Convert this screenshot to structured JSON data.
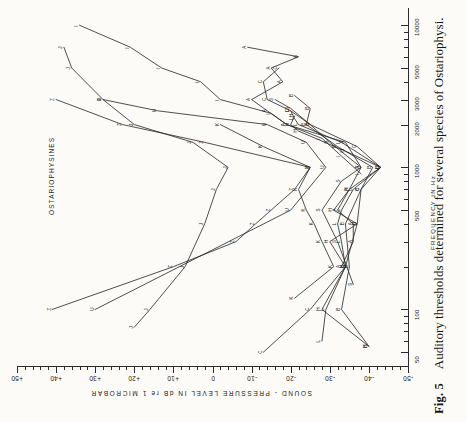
{
  "figure": {
    "number_label": "Fig. 5",
    "caption": "Auditory thresholds determined for several species of Ostariophysi.",
    "group_label": "OSTARIOPHYSINES"
  },
  "axes": {
    "x_title": "FREQUENCY  IN   Hz",
    "y_title": "SOUND - PRESSURE  LEVEL   IN   dB   re  1  MICROBAR",
    "x_tick_labels": [
      "50",
      "100",
      "500",
      "1000",
      "2000",
      "3000",
      "5000",
      "10000"
    ],
    "y_tick_labels": [
      "+50",
      "+40",
      "+30",
      "+20",
      "+10",
      "0",
      "-10",
      "-20",
      "-30",
      "-40",
      "-50"
    ]
  },
  "chart_data": {
    "type": "line",
    "title": "Auditory thresholds determined for several species of Ostariophysi.",
    "subtitle": "OSTARIOPHYSINES",
    "xlabel": "FREQUENCY  IN   Hz",
    "ylabel": "SOUND - PRESSURE  LEVEL   IN   dB   re  1  MICROBAR",
    "xscale": "log",
    "xlim": [
      40,
      12000
    ],
    "ylim": [
      -50,
      50
    ],
    "xticks": [
      50,
      100,
      500,
      1000,
      2000,
      3000,
      5000,
      10000
    ],
    "yticks": [
      50,
      40,
      30,
      20,
      10,
      0,
      -10,
      -20,
      -30,
      -40,
      -50
    ],
    "grid": false,
    "legend": "none (curves labelled by letter markers at each datum)",
    "orientation_note": "Scanned page is rotated 90 degrees counter-clockwise; frequency axis runs vertically up the right side, level axis runs horizontally along the bottom.",
    "series": [
      {
        "name": "Z",
        "marker": "Z",
        "points": [
          {
            "x": 100,
            "y": 41
          },
          {
            "x": 200,
            "y": 10
          },
          {
            "x": 300,
            "y": -6
          },
          {
            "x": 400,
            "y": -11
          },
          {
            "x": 500,
            "y": -15
          },
          {
            "x": 700,
            "y": -21
          },
          {
            "x": 1000,
            "y": -25
          },
          {
            "x": 1500,
            "y": 2
          },
          {
            "x": 2000,
            "y": 23
          },
          {
            "x": 3000,
            "y": 40
          }
        ]
      },
      {
        "name": "J",
        "marker": "J",
        "points": [
          {
            "x": 75,
            "y": 20
          },
          {
            "x": 100,
            "y": 16
          },
          {
            "x": 200,
            "y": 7
          },
          {
            "x": 400,
            "y": 2
          },
          {
            "x": 700,
            "y": -1
          },
          {
            "x": 1000,
            "y": -4
          },
          {
            "x": 1500,
            "y": 5
          },
          {
            "x": 2000,
            "y": 20
          },
          {
            "x": 3000,
            "y": 28
          },
          {
            "x": 5000,
            "y": 36
          },
          {
            "x": 7000,
            "y": 38
          }
        ]
      },
      {
        "name": "U",
        "marker": "U",
        "points": [
          {
            "x": 100,
            "y": 30
          },
          {
            "x": 500,
            "y": -20
          },
          {
            "x": 1000,
            "y": -29
          },
          {
            "x": 1500,
            "y": -24
          },
          {
            "x": 2000,
            "y": -14
          },
          {
            "x": 2500,
            "y": 14
          },
          {
            "x": 3000,
            "y": 28
          }
        ]
      },
      {
        "name": "I",
        "marker": "I",
        "points": [
          {
            "x": 900,
            "y": -38
          },
          {
            "x": 1200,
            "y": -33
          },
          {
            "x": 1600,
            "y": -28
          },
          {
            "x": 2000,
            "y": -19
          },
          {
            "x": 2400,
            "y": -15
          },
          {
            "x": 3000,
            "y": -2
          },
          {
            "x": 4000,
            "y": 3
          },
          {
            "x": 5000,
            "y": 13
          },
          {
            "x": 7000,
            "y": 21
          },
          {
            "x": 10000,
            "y": 34
          }
        ]
      },
      {
        "name": "A",
        "marker": "A",
        "points": [
          {
            "x": 200,
            "y": -33
          },
          {
            "x": 300,
            "y": -36
          },
          {
            "x": 400,
            "y": -36
          },
          {
            "x": 500,
            "y": -32
          },
          {
            "x": 700,
            "y": -35
          },
          {
            "x": 1000,
            "y": -38
          },
          {
            "x": 1500,
            "y": -34
          },
          {
            "x": 2000,
            "y": -19
          },
          {
            "x": 2500,
            "y": -14
          },
          {
            "x": 3000,
            "y": -10
          },
          {
            "x": 4000,
            "y": -18
          },
          {
            "x": 5000,
            "y": -15
          },
          {
            "x": 6000,
            "y": -22
          },
          {
            "x": 7000,
            "y": -9
          }
        ]
      },
      {
        "name": "C",
        "marker": "C",
        "points": [
          {
            "x": 50,
            "y": -13
          },
          {
            "x": 100,
            "y": -25
          },
          {
            "x": 200,
            "y": -34
          },
          {
            "x": 400,
            "y": -37
          },
          {
            "x": 700,
            "y": -38
          },
          {
            "x": 1000,
            "y": -43
          },
          {
            "x": 1400,
            "y": -37
          },
          {
            "x": 2000,
            "y": -25
          },
          {
            "x": 2500,
            "y": -20
          },
          {
            "x": 3000,
            "y": -14
          },
          {
            "x": 4000,
            "y": -13
          },
          {
            "x": 5000,
            "y": -17
          }
        ]
      },
      {
        "name": "L",
        "marker": "L",
        "points": [
          {
            "x": 60,
            "y": -28
          },
          {
            "x": 100,
            "y": -29
          },
          {
            "x": 200,
            "y": -34
          },
          {
            "x": 300,
            "y": -33
          },
          {
            "x": 400,
            "y": -32
          },
          {
            "x": 500,
            "y": -33
          },
          {
            "x": 700,
            "y": -36
          },
          {
            "x": 1000,
            "y": -43
          },
          {
            "x": 1500,
            "y": -33
          },
          {
            "x": 2000,
            "y": -22
          },
          {
            "x": 2200,
            "y": -21
          },
          {
            "x": 2500,
            "y": -20
          }
        ]
      },
      {
        "name": "H",
        "marker": "H",
        "points": [
          {
            "x": 55,
            "y": -40
          },
          {
            "x": 100,
            "y": -28
          },
          {
            "x": 200,
            "y": -34
          },
          {
            "x": 300,
            "y": -30
          },
          {
            "x": 400,
            "y": -37
          },
          {
            "x": 500,
            "y": -31
          },
          {
            "x": 700,
            "y": -35
          },
          {
            "x": 1000,
            "y": -43
          },
          {
            "x": 1300,
            "y": -34
          },
          {
            "x": 1800,
            "y": -22
          },
          {
            "x": 2000,
            "y": -20
          },
          {
            "x": 2300,
            "y": -21
          }
        ]
      },
      {
        "name": "B",
        "marker": "B",
        "points": [
          {
            "x": 55,
            "y": -40
          },
          {
            "x": 100,
            "y": -33
          },
          {
            "x": 200,
            "y": -35
          },
          {
            "x": 400,
            "y": -34
          },
          {
            "x": 700,
            "y": -38
          },
          {
            "x": 1000,
            "y": -41
          },
          {
            "x": 1400,
            "y": -32
          },
          {
            "x": 2000,
            "y": -24
          },
          {
            "x": 2600,
            "y": -25
          },
          {
            "x": 3200,
            "y": -21
          }
        ]
      },
      {
        "name": "S",
        "marker": "S",
        "points": [
          {
            "x": 150,
            "y": -36
          },
          {
            "x": 300,
            "y": -32
          },
          {
            "x": 500,
            "y": -28
          },
          {
            "x": 800,
            "y": -33
          },
          {
            "x": 1000,
            "y": -38
          },
          {
            "x": 1500,
            "y": -30
          },
          {
            "x": 2000,
            "y": -25
          },
          {
            "x": 2600,
            "y": -20
          },
          {
            "x": 3000,
            "y": -16
          }
        ]
      },
      {
        "name": "K",
        "marker": "K",
        "points": [
          {
            "x": 120,
            "y": -21
          },
          {
            "x": 200,
            "y": -31
          },
          {
            "x": 300,
            "y": -28
          },
          {
            "x": 400,
            "y": -26
          },
          {
            "x": 500,
            "y": -24
          },
          {
            "x": 700,
            "y": -22
          },
          {
            "x": 1000,
            "y": -25
          },
          {
            "x": 1400,
            "y": -13
          },
          {
            "x": 2000,
            "y": -2
          }
        ]
      }
    ]
  }
}
